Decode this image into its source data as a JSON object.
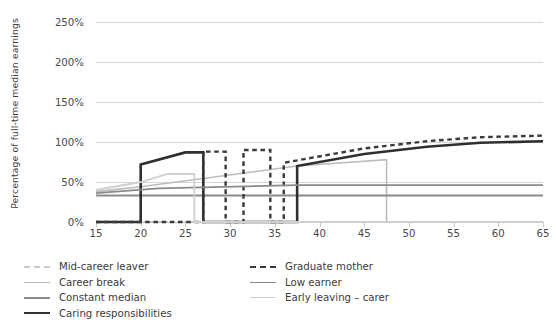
{
  "axes": {
    "y_title": "Percentage of full-time median earnings",
    "y_ticks": [
      "0%",
      "50%",
      "100%",
      "150%",
      "200%",
      "250%"
    ],
    "x_ticks": [
      "15",
      "20",
      "25",
      "30",
      "35",
      "40",
      "45",
      "50",
      "55",
      "60",
      "65"
    ]
  },
  "legend": {
    "items": [
      {
        "label": "Mid-career leaver",
        "color": "#c9c9c9",
        "width": 2.0,
        "dash": "dashed"
      },
      {
        "label": "Career break",
        "color": "#bcbcbc",
        "width": 1.6,
        "dash": "solid"
      },
      {
        "label": "Constant median",
        "color": "#8a8a8a",
        "width": 2.0,
        "dash": "solid"
      },
      {
        "label": "Caring responsibilities",
        "color": "#2f2f2f",
        "width": 2.6,
        "dash": "solid"
      },
      {
        "label": "Graduate mother",
        "color": "#3a3a3a",
        "width": 2.4,
        "dash": "dashed"
      },
      {
        "label": "Low earner",
        "color": "#8a8a8a",
        "width": 1.8,
        "dash": "solid"
      },
      {
        "label": "Early leaving – carer",
        "color": "#cfcfcf",
        "width": 1.8,
        "dash": "solid"
      }
    ]
  },
  "chart_data": {
    "type": "line",
    "title": "",
    "xlabel": "",
    "ylabel": "Percentage of full-time median earnings",
    "xlim": [
      15,
      65
    ],
    "ylim": [
      0,
      250
    ],
    "grid": true,
    "legend_position": "below",
    "series": [
      {
        "name": "Mid-career leaver",
        "color": "#c9c9c9",
        "dash": "dashed",
        "width": 2.0,
        "points": [
          [
            15,
            0
          ],
          [
            65,
            0
          ]
        ]
      },
      {
        "name": "Career break",
        "color": "#bcbcbc",
        "dash": "solid",
        "width": 1.6,
        "points": [
          [
            15,
            38
          ],
          [
            20,
            44
          ],
          [
            37.5,
            70
          ],
          [
            47.5,
            78
          ],
          [
            47.5,
            0
          ],
          [
            65,
            0
          ]
        ]
      },
      {
        "name": "Constant median",
        "color": "#8a8a8a",
        "dash": "solid",
        "width": 2.0,
        "points": [
          [
            15,
            33
          ],
          [
            65,
            33
          ]
        ]
      },
      {
        "name": "Caring responsibilities",
        "color": "#2f2f2f",
        "dash": "solid",
        "width": 2.6,
        "points": [
          [
            15,
            0
          ],
          [
            20,
            0
          ],
          [
            20,
            72
          ],
          [
            25,
            87
          ],
          [
            27,
            87
          ],
          [
            27,
            0
          ],
          [
            37.5,
            0
          ],
          [
            37.5,
            70
          ],
          [
            45,
            85
          ],
          [
            52,
            94
          ],
          [
            58,
            99
          ],
          [
            65,
            101
          ]
        ]
      },
      {
        "name": "Graduate mother",
        "color": "#3a3a3a",
        "dash": "dashed",
        "width": 2.4,
        "points": [
          [
            15,
            0
          ],
          [
            27,
            0
          ],
          [
            27,
            88
          ],
          [
            29.5,
            88
          ],
          [
            29.5,
            0
          ],
          [
            31.5,
            0
          ],
          [
            31.5,
            90
          ],
          [
            34.5,
            90
          ],
          [
            34.5,
            0
          ],
          [
            36,
            0
          ],
          [
            36,
            74
          ],
          [
            45,
            92
          ],
          [
            52,
            101
          ],
          [
            58,
            106
          ],
          [
            65,
            108
          ]
        ]
      },
      {
        "name": "Low earner",
        "color": "#8a8a8a",
        "dash": "solid",
        "width": 1.8,
        "points": [
          [
            15,
            36
          ],
          [
            22,
            42
          ],
          [
            37.5,
            46
          ],
          [
            65,
            46
          ]
        ]
      },
      {
        "name": "Early leaving – carer",
        "color": "#cfcfcf",
        "dash": "solid",
        "width": 1.8,
        "points": [
          [
            15,
            40
          ],
          [
            20,
            50
          ],
          [
            23,
            60
          ],
          [
            26,
            60
          ],
          [
            26,
            0
          ],
          [
            65,
            0
          ]
        ]
      }
    ]
  }
}
